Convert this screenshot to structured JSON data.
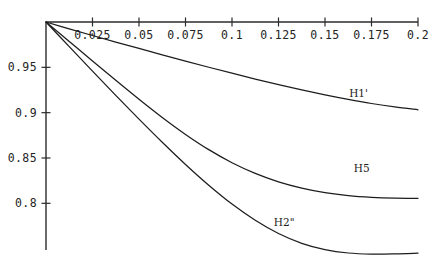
{
  "chart_data": {
    "type": "line",
    "title": "",
    "subtitle": "",
    "xlabel": "",
    "ylabel": "",
    "xlim": [
      0,
      0.2
    ],
    "ylim": [
      0.74,
      1.0
    ],
    "grid": false,
    "legend_position": "inline-right",
    "xticks": [
      {
        "value": 0.025,
        "label": "0.025"
      },
      {
        "value": 0.05,
        "label": "0.05"
      },
      {
        "value": 0.075,
        "label": "0.075"
      },
      {
        "value": 0.1,
        "label": "0.1"
      },
      {
        "value": 0.125,
        "label": "0.125"
      },
      {
        "value": 0.15,
        "label": "0.15"
      },
      {
        "value": 0.175,
        "label": "0.175"
      },
      {
        "value": 0.2,
        "label": "0.2"
      }
    ],
    "yticks": [
      {
        "value": 0.95,
        "label": "0.95"
      },
      {
        "value": 0.9,
        "label": "0.9"
      },
      {
        "value": 0.85,
        "label": "0.85"
      },
      {
        "value": 0.8,
        "label": "0.8"
      }
    ],
    "series": [
      {
        "name": "H1'",
        "label": "H1'",
        "color": "#1d1d1d",
        "label_x": 0.163,
        "label_y": 0.917,
        "x": [
          0.0,
          0.0125,
          0.025,
          0.0375,
          0.05,
          0.0625,
          0.075,
          0.0875,
          0.1,
          0.1125,
          0.125,
          0.1375,
          0.15,
          0.1625,
          0.175,
          0.1875,
          0.2
        ],
        "y": [
          1.0,
          0.9925,
          0.9851,
          0.9779,
          0.9708,
          0.9638,
          0.9569,
          0.9501,
          0.9435,
          0.9371,
          0.9309,
          0.9251,
          0.9196,
          0.9146,
          0.9101,
          0.9063,
          0.9032
        ]
      },
      {
        "name": "H5",
        "label": "H5",
        "color": "#1d1d1d",
        "label_x": 0.1655,
        "label_y": 0.8345,
        "x": [
          0.0,
          0.0125,
          0.025,
          0.0375,
          0.05,
          0.0625,
          0.075,
          0.0875,
          0.1,
          0.1125,
          0.125,
          0.1375,
          0.15,
          0.1625,
          0.175,
          0.1875,
          0.2
        ],
        "y": [
          1.0,
          0.9785,
          0.957,
          0.9357,
          0.9148,
          0.8947,
          0.876,
          0.8592,
          0.8448,
          0.833,
          0.8237,
          0.8168,
          0.8118,
          0.8085,
          0.8066,
          0.8057,
          0.8055
        ]
      },
      {
        "name": "H2''",
        "label": "H2\"",
        "color": "#1d1d1d",
        "label_x": 0.1225,
        "label_y": 0.7745,
        "x": [
          0.0,
          0.0125,
          0.025,
          0.0375,
          0.05,
          0.0625,
          0.075,
          0.0875,
          0.1,
          0.1125,
          0.125,
          0.1375,
          0.15,
          0.1625,
          0.175,
          0.1875,
          0.2
        ],
        "y": [
          1.0,
          0.9728,
          0.9458,
          0.9191,
          0.8929,
          0.8674,
          0.8429,
          0.82,
          0.7992,
          0.7813,
          0.7667,
          0.7559,
          0.7489,
          0.7452,
          0.744,
          0.7442,
          0.745
        ]
      }
    ]
  },
  "axes": {
    "x_axis_name": "x-axis",
    "y_axis_name": "y-axis"
  }
}
